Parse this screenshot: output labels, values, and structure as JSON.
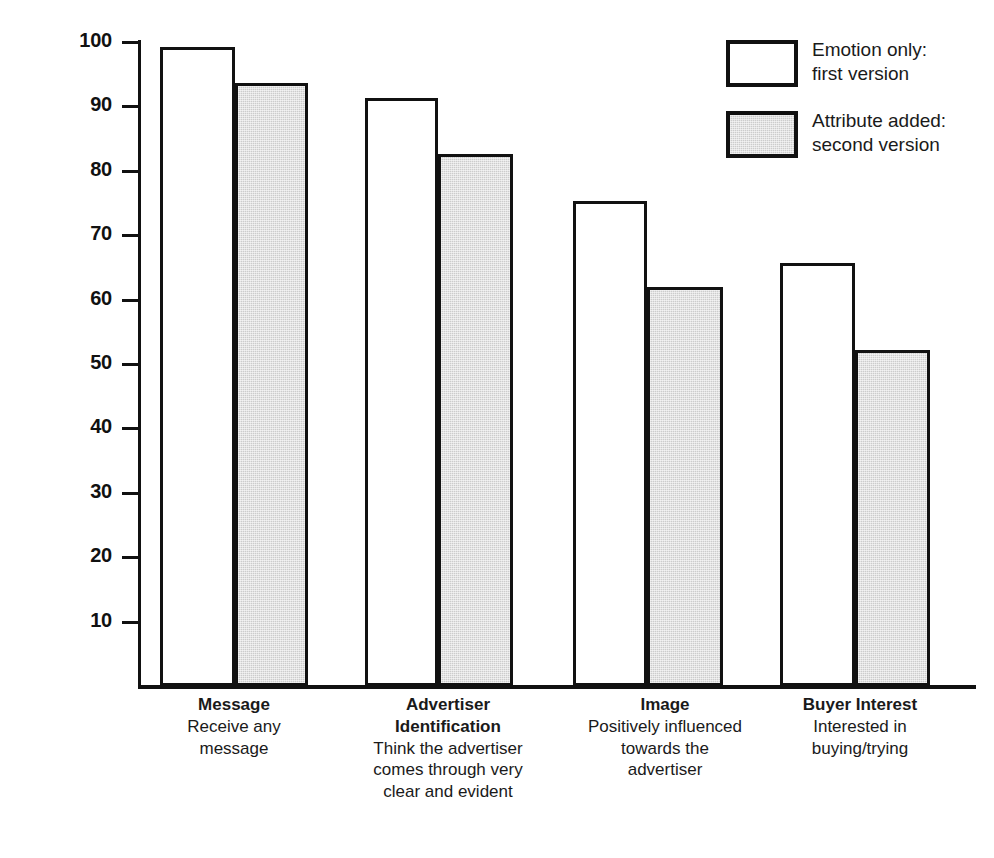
{
  "chart_data": {
    "type": "bar",
    "title": "",
    "subtitle": "",
    "xlabel": "",
    "ylabel": "Per cent",
    "ylim": [
      0,
      100
    ],
    "yticks": [
      100,
      90,
      80,
      70,
      60,
      50,
      40,
      30,
      20,
      10
    ],
    "ytick_labels": [
      "100",
      "90",
      "80",
      "70",
      "60",
      "50",
      "40",
      "30",
      "20",
      "10"
    ],
    "grid": false,
    "legend_position": "top-right",
    "categories": [
      "Message",
      "Advertiser Identification",
      "Image",
      "Buyer Interest"
    ],
    "category_descriptions": [
      "Receive any message",
      "Think the advertiser comes through very clear and evident",
      "Positively influenced towards the advertiser",
      "Interested in buying/trying"
    ],
    "series": [
      {
        "name": "Emotion only: first version",
        "color": "#ffffff",
        "values": [
          99.3,
          91.3,
          75.3,
          65.7
        ]
      },
      {
        "name": "Attribute added: second version",
        "color": "#cccccc",
        "values": [
          93.6,
          82.6,
          61.9,
          52.1
        ]
      }
    ]
  },
  "axis": {
    "y_title": "Per cent",
    "ticks": [
      {
        "label": "100",
        "value": 100
      },
      {
        "label": "90",
        "value": 90
      },
      {
        "label": "80",
        "value": 80
      },
      {
        "label": "70",
        "value": 70
      },
      {
        "label": "60",
        "value": 60
      },
      {
        "label": "50",
        "value": 50
      },
      {
        "label": "40",
        "value": 40
      },
      {
        "label": "30",
        "value": 30
      },
      {
        "label": "20",
        "value": 20
      },
      {
        "label": "10",
        "value": 10
      }
    ]
  },
  "legend": {
    "items": [
      {
        "label": "Emotion only:\nfirst version",
        "swatch": "white-outline-swatch"
      },
      {
        "label": "Attribute added:\nsecond version",
        "swatch": "gray-filled-swatch"
      }
    ]
  },
  "categories": [
    {
      "title": "Message",
      "description": "Receive any\nmessage"
    },
    {
      "title": "Advertiser\nIdentification",
      "description": "Think the advertiser\ncomes through very\nclear and evident"
    },
    {
      "title": "Image",
      "description": "Positively influenced\ntowards the\nadvertiser"
    },
    {
      "title": "Buyer Interest",
      "description": "Interested in\nbuying/trying"
    }
  ],
  "colors": {
    "axis": "#111111",
    "series_first": "#ffffff",
    "series_second": "#cccccc",
    "text": "#1a1a1a",
    "background": "#ffffff"
  }
}
